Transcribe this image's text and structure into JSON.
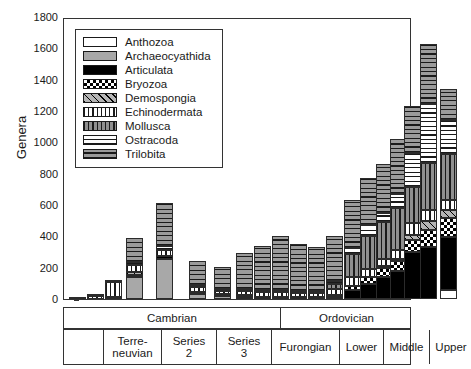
{
  "chart_data": {
    "type": "bar",
    "stacked": true,
    "title": "",
    "xlabel": "",
    "ylabel": "Genera",
    "ylim": [
      0,
      1800
    ],
    "ytick_labels": [
      "0",
      "200",
      "400",
      "600",
      "800",
      "1000",
      "1200",
      "1400",
      "1600",
      "1800"
    ],
    "ytick_values": [
      0,
      200,
      400,
      600,
      800,
      1000,
      1200,
      1400,
      1600,
      1800
    ],
    "grid": false,
    "legend_position": "upper-left-inside",
    "series": [
      {
        "name": "Anthozoa",
        "pattern": "white-solid",
        "values": [
          0,
          0,
          0,
          0,
          0,
          0,
          0,
          0,
          0,
          0,
          0,
          0,
          0,
          0,
          0,
          0,
          0,
          0,
          0,
          60
        ]
      },
      {
        "name": "Archaeocyathida",
        "pattern": "gray-solid",
        "values": [
          0,
          0,
          8,
          140,
          255,
          30,
          18,
          10,
          0,
          0,
          0,
          0,
          0,
          0,
          0,
          0,
          0,
          0,
          0,
          0
        ]
      },
      {
        "name": "Articulata",
        "pattern": "black-solid",
        "values": [
          0,
          0,
          0,
          10,
          18,
          16,
          14,
          12,
          10,
          8,
          8,
          8,
          10,
          55,
          95,
          140,
          180,
          300,
          330,
          335
        ]
      },
      {
        "name": "Bryozoa",
        "pattern": "checkered",
        "values": [
          0,
          0,
          0,
          0,
          0,
          0,
          0,
          0,
          0,
          0,
          0,
          0,
          8,
          30,
          45,
          55,
          60,
          75,
          110,
          120
        ]
      },
      {
        "name": "Demospongia",
        "pattern": "diagonal-hatch",
        "values": [
          0,
          0,
          0,
          22,
          0,
          0,
          0,
          0,
          0,
          0,
          0,
          0,
          0,
          0,
          0,
          10,
          15,
          35,
          60,
          55
        ]
      },
      {
        "name": "Echinodermata",
        "pattern": "vertical-lines-white",
        "values": [
          6,
          22,
          95,
          40,
          42,
          30,
          22,
          26,
          30,
          30,
          26,
          24,
          40,
          55,
          50,
          48,
          60,
          75,
          70,
          65
        ]
      },
      {
        "name": "Mollusca",
        "pattern": "vertical-lines-gray",
        "values": [
          0,
          0,
          0,
          0,
          0,
          0,
          0,
          0,
          0,
          0,
          0,
          0,
          30,
          145,
          215,
          235,
          265,
          230,
          300,
          290
        ]
      },
      {
        "name": "Ostracoda",
        "pattern": "horizontal-lines-white",
        "values": [
          0,
          0,
          0,
          20,
          22,
          10,
          8,
          10,
          8,
          10,
          10,
          8,
          20,
          40,
          70,
          60,
          90,
          220,
          375,
          215
        ]
      },
      {
        "name": "Trilobita",
        "pattern": "horizontal-lines-gray",
        "values": [
          0,
          8,
          8,
          155,
          275,
          155,
          135,
          230,
          280,
          345,
          300,
          280,
          290,
          305,
          300,
          310,
          350,
          300,
          380,
          200
        ]
      }
    ],
    "bar_positions_px": [
      5,
      23,
      41,
      62,
      92,
      125,
      150,
      172,
      190,
      208,
      226,
      244,
      262,
      280,
      296,
      312,
      326,
      340,
      356,
      376
    ],
    "bar_width_px": 17,
    "bar_totals": [
      6,
      30,
      111,
      387,
      612,
      241,
      197,
      288,
      328,
      393,
      344,
      320,
      398,
      630,
      775,
      858,
      920,
      1235,
      1625,
      1340
    ]
  },
  "legend": {
    "entries": [
      {
        "label": "Anthozoa",
        "swatch": "p-anthozoa"
      },
      {
        "label": "Archaeocyathida",
        "swatch": "p-archaeocyathida"
      },
      {
        "label": "Articulata",
        "swatch": "p-articulata"
      },
      {
        "label": "Bryozoa",
        "swatch": "p-bryozoa"
      },
      {
        "label": "Demospongia",
        "swatch": "p-demospongia"
      },
      {
        "label": "Echinodermata",
        "swatch": "p-echinodermata"
      },
      {
        "label": "Mollusca",
        "swatch": "p-mollusca"
      },
      {
        "label": "Ostracoda",
        "swatch": "p-ostracoda"
      },
      {
        "label": "Trilobita",
        "swatch": "p-trilobita"
      }
    ]
  },
  "axis": {
    "ylabel": "Genera",
    "periods": [
      {
        "label": "Cambrian",
        "span_px": 217
      },
      {
        "label": "Ordovician",
        "span_px": 131
      }
    ],
    "series_cells": [
      {
        "label": "",
        "line2": "",
        "span_px": 40
      },
      {
        "label": "Terre-",
        "line2": "neuvian",
        "span_px": 58
      },
      {
        "label": "Series",
        "line2": "2",
        "span_px": 55
      },
      {
        "label": "Series",
        "line2": "3",
        "span_px": 55
      },
      {
        "label": "Furongian",
        "line2": "",
        "span_px": 68
      },
      {
        "label": "Lower",
        "line2": "",
        "span_px": 44
      },
      {
        "label": "Middle",
        "line2": "",
        "span_px": 46
      },
      {
        "label": "Upper",
        "line2": "",
        "span_px": 42
      }
    ]
  },
  "colors": {
    "axis": "#333333",
    "gray_fill": "#a8a8a8",
    "black_fill": "#000000",
    "white_fill": "#ffffff"
  }
}
